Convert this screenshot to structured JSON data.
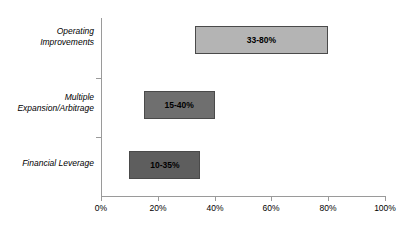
{
  "chart_data": {
    "type": "bar",
    "orientation": "horizontal",
    "subtype": "floating-range-bar",
    "title": "",
    "xlabel": "",
    "ylabel": "",
    "xlim": [
      0,
      100
    ],
    "xunit": "%",
    "grid": false,
    "legend": false,
    "xticks": [
      0,
      20,
      40,
      60,
      80,
      100
    ],
    "xticklabels": [
      "0%",
      "20%",
      "40%",
      "60%",
      "80%",
      "100%"
    ],
    "categories": [
      "Operating\nImprovements",
      "Multiple\nExpansion/Arbitrage",
      "Financial Leverage"
    ],
    "bars": [
      {
        "category": "Operating\nImprovements",
        "start": 33,
        "end": 80,
        "label": "33-80%",
        "color": "#b4b4b4"
      },
      {
        "category": "Multiple\nExpansion/Arbitrage",
        "start": 15,
        "end": 40,
        "label": "15-40%",
        "color": "#6f6f6f"
      },
      {
        "category": "Financial Leverage",
        "start": 10,
        "end": 35,
        "label": "10-35%",
        "color": "#5e5e5e"
      }
    ],
    "colors": {
      "axis": "#9a9a9a",
      "bar_border": "#4a4a4a",
      "text": "#000000",
      "background": "#ffffff"
    }
  }
}
